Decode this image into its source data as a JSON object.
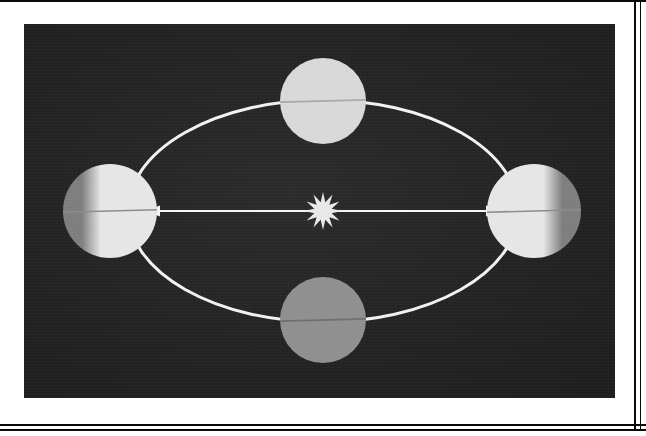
{
  "figure": {
    "title": "Earth's orbit around the Sun showing axial tilt at four orbital positions",
    "plate_background_color": "#232323",
    "orbit_stroke_color": "#f2f2f2",
    "arrow_color": "#f5f5f5",
    "page_background_color": "#ffffff",
    "frame_rule_color": "#0a0a0a"
  },
  "sun": {
    "label": "Sun",
    "icon": "sun-starburst-icon",
    "color": "#e8e8e8",
    "center_x": 323,
    "center_y": 211,
    "outer_radius": 19,
    "inner_radius": 9,
    "points": 12
  },
  "orbit": {
    "label": "Orbital path",
    "center_x": 323,
    "center_y": 211,
    "radius_x": 195,
    "radius_y": 111,
    "stroke_width": 3
  },
  "axis_arrow": {
    "label": "Major axis of orbit",
    "left_tip_x": 146,
    "right_tip_x": 500,
    "y": 211,
    "stroke_width": 2,
    "head_length": 14,
    "head_width": 11
  },
  "planets": [
    {
      "name": "planet-left",
      "position_label": "Left orbital position",
      "center_x": 110,
      "center_y": 211,
      "radius": 47,
      "lit_color": "#e6e6e6",
      "shadow_color": "#7e7e7e",
      "lit_side": "right",
      "terminator_offset": -0.18,
      "axis_tilt_degrees": 23.5,
      "axis_line_color": "#8c8c8c"
    },
    {
      "name": "planet-top",
      "position_label": "Top orbital position",
      "center_x": 323,
      "center_y": 101,
      "radius": 43,
      "lit_color": "#d8d8d8",
      "shadow_color": "#d8d8d8",
      "lit_side": "none",
      "terminator_offset": 0,
      "axis_tilt_degrees": 23.5,
      "axis_line_color": "#a8a8a8"
    },
    {
      "name": "planet-right",
      "position_label": "Right orbital position",
      "center_x": 534,
      "center_y": 211,
      "radius": 47,
      "lit_color": "#e6e6e6",
      "shadow_color": "#7e7e7e",
      "lit_side": "left",
      "terminator_offset": 0.18,
      "axis_tilt_degrees": 23.5,
      "axis_line_color": "#8c8c8c"
    },
    {
      "name": "planet-bottom",
      "position_label": "Bottom orbital position",
      "center_x": 323,
      "center_y": 320,
      "radius": 43,
      "lit_color": "#8f8f8f",
      "shadow_color": "#8f8f8f",
      "lit_side": "none",
      "terminator_offset": 0,
      "axis_tilt_degrees": 23.5,
      "axis_line_color": "#6e6e6e"
    }
  ]
}
